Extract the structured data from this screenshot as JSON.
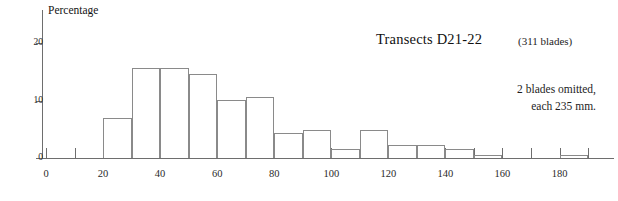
{
  "chart_data": {
    "type": "bar",
    "title": "Transects D21-22",
    "subtitle": "(311 blades)",
    "xlabel": "",
    "ylabel": "Percentage",
    "xlim": [
      0,
      192
    ],
    "ylim": [
      0,
      25
    ],
    "grid": false,
    "legend": null,
    "bin_width": 10,
    "categories": [
      "20-30",
      "30-40",
      "40-50",
      "50-60",
      "60-70",
      "70-80",
      "80-90",
      "90-100",
      "100-110",
      "110-120",
      "120-130",
      "130-140",
      "140-150",
      "150-160",
      "180-190"
    ],
    "bin_starts": [
      20,
      30,
      40,
      50,
      60,
      70,
      80,
      90,
      100,
      110,
      120,
      130,
      140,
      150,
      180
    ],
    "values": [
      7.0,
      15.7,
      15.7,
      14.6,
      10.1,
      10.6,
      4.3,
      4.9,
      1.6,
      4.9,
      2.3,
      2.2,
      1.5,
      0.6,
      0.5
    ],
    "x_tick_labels": [
      "0",
      "20",
      "40",
      "60",
      "80",
      "100",
      "120",
      "140",
      "160",
      "180"
    ],
    "x_tick_values": [
      0,
      20,
      40,
      60,
      80,
      100,
      120,
      140,
      160,
      180
    ],
    "x_minor_tick_values": [
      10,
      30,
      50,
      70,
      90,
      110,
      130,
      150,
      170,
      190
    ],
    "y_tick_labels": [
      "0",
      "10",
      "20"
    ],
    "y_tick_values": [
      0,
      10,
      20
    ],
    "annotations": [
      "2 blades omitted,",
      "each 235 mm."
    ],
    "colors": {
      "bar_outline": "#8a8a8a",
      "axis": "#6e6e6e",
      "text": "#1a1a1a",
      "background": "#ffffff"
    }
  }
}
